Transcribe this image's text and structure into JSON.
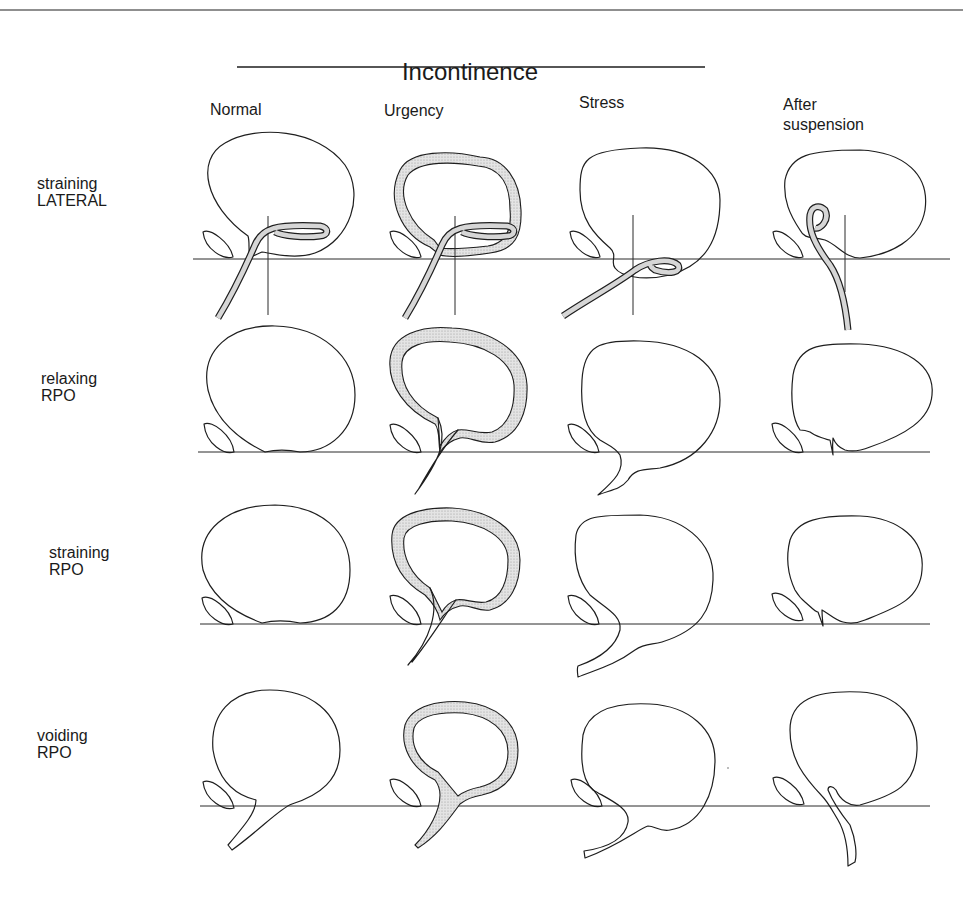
{
  "figure": {
    "title": "Incontinence",
    "columns": [
      {
        "id": "normal",
        "label": "Normal"
      },
      {
        "id": "urgency",
        "label": "Urgency"
      },
      {
        "id": "stress",
        "label": "Stress"
      },
      {
        "id": "after_suspension",
        "label_line1": "After",
        "label_line2": "suspension"
      }
    ],
    "rows": [
      {
        "id": "straining_lateral",
        "line1": "straining",
        "line2": "LATERAL"
      },
      {
        "id": "relaxing_rpo",
        "line1": "relaxing",
        "line2": "RPO"
      },
      {
        "id": "straining_rpo",
        "line1": "straining",
        "line2": "RPO"
      },
      {
        "id": "voiding_rpo",
        "line1": "voiding",
        "line2": "RPO"
      }
    ],
    "colors": {
      "ink": "#1e1e1e",
      "shading": "#d6d6d6",
      "background": "#ffffff"
    }
  }
}
